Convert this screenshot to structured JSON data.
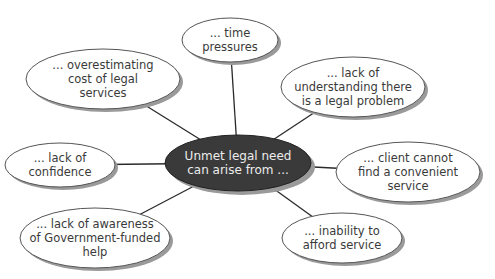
{
  "diagram": {
    "type": "mind-map",
    "colors": {
      "background": "#ffffff",
      "center_fill": "#3a3a3a",
      "center_text": "#ececec",
      "node_fill": "#ffffff",
      "node_stroke": "#555555",
      "shadow": "#9a9a9a",
      "connector": "#2a2a2a",
      "node_text": "#3a3a3a"
    },
    "center": {
      "lines": [
        "Unmet legal need",
        "can arise from ..."
      ],
      "cx": 238,
      "cy": 163,
      "rx": 73,
      "ry": 28
    },
    "nodes": [
      {
        "id": "time-pressures",
        "lines": [
          "... time",
          "pressures"
        ],
        "cx": 230,
        "cy": 40,
        "rx": 48,
        "ry": 22
      },
      {
        "id": "overestimating-cost",
        "lines": [
          "... overestimating",
          "cost of legal",
          "services"
        ],
        "cx": 103,
        "cy": 79,
        "rx": 77,
        "ry": 30
      },
      {
        "id": "lack-of-understanding",
        "lines": [
          "... lack of",
          "understanding there",
          "is a legal problem"
        ],
        "cx": 353,
        "cy": 87,
        "rx": 72,
        "ry": 30
      },
      {
        "id": "lack-of-confidence",
        "lines": [
          "... lack of",
          "confidence"
        ],
        "cx": 60,
        "cy": 165,
        "rx": 55,
        "ry": 22
      },
      {
        "id": "client-cannot-find-service",
        "lines": [
          "... client cannot",
          "find a convenient",
          "service"
        ],
        "cx": 408,
        "cy": 172,
        "rx": 72,
        "ry": 30
      },
      {
        "id": "lack-of-awareness",
        "lines": [
          "... lack of awareness",
          "of Government-funded",
          "help"
        ],
        "cx": 95,
        "cy": 238,
        "rx": 75,
        "ry": 30
      },
      {
        "id": "inability-to-afford",
        "lines": [
          "... inability to",
          "afford service"
        ],
        "cx": 342,
        "cy": 238,
        "rx": 60,
        "ry": 25
      }
    ]
  }
}
